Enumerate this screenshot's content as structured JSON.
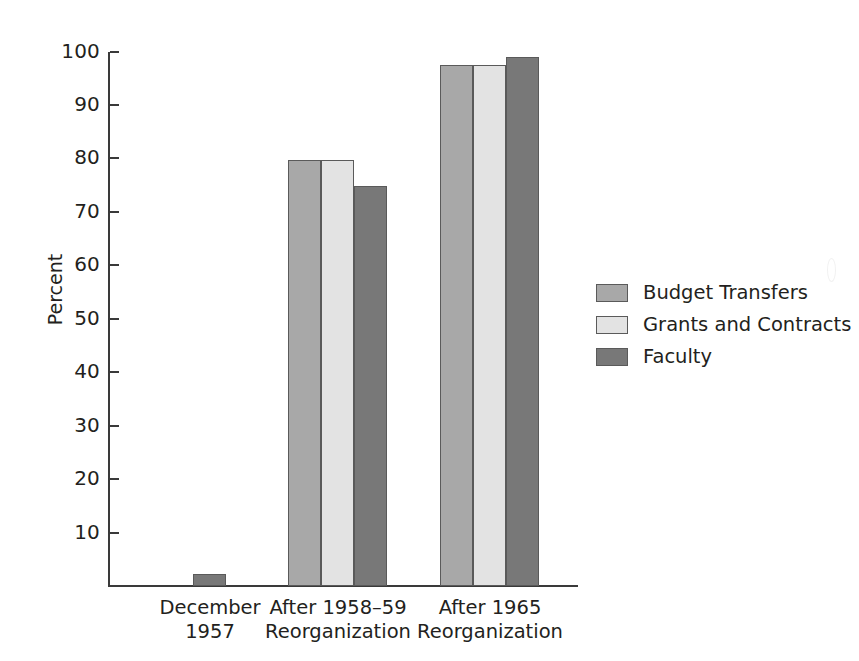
{
  "chart_data": {
    "type": "bar",
    "title": "",
    "subtitle": "",
    "xlabel": "",
    "ylabel": "Percent",
    "ylim": [
      0,
      100
    ],
    "yticks": [
      10,
      20,
      30,
      40,
      50,
      60,
      70,
      80,
      90,
      100
    ],
    "ytick_labels": [
      "10",
      "20",
      "30",
      "40",
      "50",
      "60",
      "70",
      "80",
      "90",
      "100"
    ],
    "grid": false,
    "legend_position": "right",
    "categories": [
      "December\n1957",
      "After 1958–59\nReorganization",
      "After 1965\nReorganization"
    ],
    "category_lines": [
      [
        "December",
        "1957"
      ],
      [
        "After 1958–59",
        "Reorganization"
      ],
      [
        "After 1965",
        "Reorganization"
      ]
    ],
    "series": [
      {
        "name": "Budget Transfers",
        "color": "#a8a8a8",
        "values": [
          null,
          79.7,
          97.5
        ]
      },
      {
        "name": "Grants and Contracts",
        "color": "#e3e3e3",
        "values": [
          null,
          79.7,
          97.5
        ]
      },
      {
        "name": "Faculty",
        "color": "#787878",
        "values": [
          2.2,
          74.8,
          99.0
        ]
      }
    ]
  },
  "axis": {
    "y_title": "Percent",
    "ticks": [
      {
        "value": 100,
        "label": "100"
      },
      {
        "value": 90,
        "label": "90"
      },
      {
        "value": 80,
        "label": "80"
      },
      {
        "value": 70,
        "label": "70"
      },
      {
        "value": 60,
        "label": "60"
      },
      {
        "value": 50,
        "label": "50"
      },
      {
        "value": 40,
        "label": "40"
      },
      {
        "value": 30,
        "label": "30"
      },
      {
        "value": 20,
        "label": "20"
      },
      {
        "value": 10,
        "label": "10"
      }
    ]
  },
  "legend": {
    "items": [
      {
        "label": "Budget Transfers",
        "color": "#a8a8a8"
      },
      {
        "label": "Grants and Contracts",
        "color": "#e3e3e3"
      },
      {
        "label": "Faculty",
        "color": "#787878"
      }
    ]
  },
  "groups": [
    {
      "line1": "December",
      "line2": "1957"
    },
    {
      "line1": "After 1958–59",
      "line2": "Reorganization"
    },
    {
      "line1": "After 1965",
      "line2": "Reorganization"
    }
  ],
  "colors": {
    "budget_transfers": "#a8a8a8",
    "grants_and_contracts": "#e3e3e3",
    "faculty": "#787878",
    "axis": "#3a3a3a",
    "text": "#231f20",
    "background": "#ffffff"
  }
}
